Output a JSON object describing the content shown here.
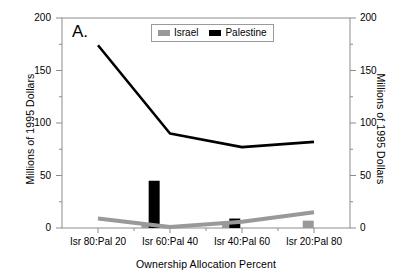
{
  "figure": {
    "panel_label": "A.",
    "background_color": "#ffffff"
  },
  "axes": {
    "left": {
      "title": "Millions of 1995 Dollars",
      "ticks": [
        "0",
        "50",
        "100",
        "150",
        "200"
      ]
    },
    "right": {
      "title": "Millions of 1995 Dollars",
      "ticks": [
        "0",
        "50",
        "100",
        "150",
        "200"
      ]
    },
    "bottom": {
      "title": "Ownership Allocation Percent",
      "ticks": [
        "Isr 80:Pal 20",
        "Isr 60:Pal 40",
        "Isr 40:Pal 60",
        "Isr 20:Pal 80"
      ]
    }
  },
  "legend": {
    "items": [
      {
        "label": "Israel",
        "color": "#999999"
      },
      {
        "label": "Palestine",
        "color": "#000000"
      }
    ]
  },
  "chart_data": {
    "type": "line",
    "title": "A.",
    "xlabel": "Ownership Allocation Percent",
    "ylabel": "Millions of 1995 Dollars",
    "ylim": [
      0,
      200
    ],
    "yticks": [
      0,
      50,
      100,
      150,
      200
    ],
    "minor_yticks": [
      25,
      75,
      125,
      175
    ],
    "grid": false,
    "legend_position": "top-center",
    "categories": [
      "Isr 80:Pal 20",
      "Isr 60:Pal 40",
      "Isr 40:Pal 60",
      "Isr 20:Pal 80"
    ],
    "series": [
      {
        "name": "Israel",
        "type": "line",
        "color": "#999999",
        "values": [
          9,
          1,
          6,
          15
        ]
      },
      {
        "name": "Palestine",
        "type": "line",
        "color": "#000000",
        "values": [
          174,
          90,
          77,
          82
        ]
      }
    ],
    "bars": [
      {
        "series": "Palestine",
        "color": "#000000",
        "x_position": 0.32,
        "value": 45
      },
      {
        "series": "Israel",
        "color": "#999999",
        "x_position": 0.295,
        "value": 3
      },
      {
        "series": "Palestine",
        "color": "#000000",
        "x_position": 0.6,
        "value": 9
      },
      {
        "series": "Israel",
        "color": "#999999",
        "x_position": 0.575,
        "value": 4
      },
      {
        "series": "Israel",
        "color": "#999999",
        "x_position": 0.855,
        "value": 7
      }
    ]
  }
}
